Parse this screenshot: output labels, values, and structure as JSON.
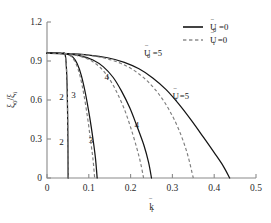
{
  "figure": {
    "background_color": "#ffffff",
    "solid_color": "#141414",
    "dashed_color": "#7d7d7d",
    "axis_color": "#8a8a8a"
  },
  "axes": {
    "x": {
      "label": "k̄",
      "label_sub": "r",
      "ticks": [
        "0",
        "0.1",
        "0.2",
        "0.3",
        "0.4",
        "0.5"
      ],
      "tick_values": [
        0,
        0.1,
        0.2,
        0.3,
        0.4,
        0.5
      ],
      "range": [
        0,
        0.5
      ]
    },
    "y": {
      "label_num": "ξ",
      "label_num_sub": "0",
      "label_den": "ξ",
      "label_den_sub": "i",
      "label": "ξ₀/ξᵢ",
      "ticks": [
        "0",
        "0.3",
        "0.6",
        "0.9",
        "1.2"
      ],
      "tick_values": [
        0,
        0.3,
        0.6,
        0.9,
        1.2
      ],
      "range": [
        0,
        1.2
      ]
    }
  },
  "legend": {
    "position": "top-right",
    "entries": [
      {
        "style": "solid",
        "symbol": "Ū",
        "sub": "0",
        "eq": "=0",
        "label": "Ū0 =0"
      },
      {
        "style": "dashed",
        "symbol": "Ū",
        "sub": "i",
        "eq": "=0",
        "label": "Ūi =0"
      }
    ]
  },
  "annotations": [
    {
      "name": "curve-label-2-upper",
      "text": "2",
      "x": 0.0345,
      "y": 0.6
    },
    {
      "name": "curve-label-2-lower",
      "text": "2",
      "x": 0.0345,
      "y": 0.255
    },
    {
      "name": "curve-label-3-upper",
      "text": "3",
      "x": 0.0635,
      "y": 0.615
    },
    {
      "name": "curve-label-3-lower",
      "text": "3",
      "x": 0.105,
      "y": 0.27
    },
    {
      "name": "curve-label-4-upper",
      "text": "4",
      "x": 0.143,
      "y": 0.755
    },
    {
      "name": "curve-label-4-lower",
      "text": "4",
      "x": 0.215,
      "y": 0.385
    },
    {
      "name": "curve-label-u0-5",
      "text": "Ū0 =5",
      "x": 0.232,
      "y": 0.935
    },
    {
      "name": "curve-label-ui-5",
      "text": "Ūi =5",
      "x": 0.3,
      "y": 0.605
    }
  ],
  "chart_data": {
    "type": "line",
    "title": "",
    "xlabel": "k̄r",
    "ylabel": "ξ0/ξi",
    "xlim": [
      0,
      0.5
    ],
    "ylim": [
      0,
      1.2
    ],
    "grid": false,
    "legend_position": "top-right",
    "plateau_value": 0.96,
    "series": [
      {
        "name": "Ū0 = 2",
        "style": "solid",
        "label": "2",
        "color": "#141414",
        "x": [
          0.0,
          0.02,
          0.035,
          0.044,
          0.048,
          0.05,
          0.0505
        ],
        "y": [
          0.96,
          0.96,
          0.958,
          0.94,
          0.72,
          0.3,
          0.0
        ]
      },
      {
        "name": "Ūi = 2",
        "style": "dashed",
        "label": "2",
        "color": "#7d7d7d",
        "x": [
          0.0,
          0.02,
          0.035,
          0.044,
          0.048,
          0.05,
          0.0505
        ],
        "y": [
          0.96,
          0.96,
          0.958,
          0.94,
          0.72,
          0.3,
          0.0
        ]
      },
      {
        "name": "Ū0 = 3",
        "style": "solid",
        "label": "3",
        "color": "#141414",
        "x": [
          0.0,
          0.03,
          0.05,
          0.062,
          0.072,
          0.082,
          0.092,
          0.102,
          0.11,
          0.116,
          0.12
        ],
        "y": [
          0.96,
          0.958,
          0.95,
          0.93,
          0.88,
          0.79,
          0.65,
          0.47,
          0.3,
          0.15,
          0.0
        ]
      },
      {
        "name": "Ūi = 3",
        "style": "dashed",
        "label": "3",
        "color": "#7d7d7d",
        "x": [
          0.0,
          0.03,
          0.05,
          0.06,
          0.07,
          0.079,
          0.088,
          0.097,
          0.104,
          0.11,
          0.114
        ],
        "y": [
          0.96,
          0.958,
          0.948,
          0.928,
          0.875,
          0.785,
          0.645,
          0.465,
          0.295,
          0.145,
          0.0
        ]
      },
      {
        "name": "Ū0 = 4",
        "style": "solid",
        "label": "4",
        "color": "#141414",
        "x": [
          0.0,
          0.04,
          0.08,
          0.11,
          0.135,
          0.158,
          0.178,
          0.198,
          0.215,
          0.232,
          0.243,
          0.25
        ],
        "y": [
          0.96,
          0.956,
          0.94,
          0.908,
          0.855,
          0.775,
          0.67,
          0.54,
          0.4,
          0.25,
          0.12,
          0.0
        ]
      },
      {
        "name": "Ūi = 4",
        "style": "dashed",
        "label": "4",
        "color": "#7d7d7d",
        "x": [
          0.0,
          0.04,
          0.078,
          0.105,
          0.128,
          0.148,
          0.167,
          0.185,
          0.2,
          0.214,
          0.224,
          0.231
        ],
        "y": [
          0.96,
          0.955,
          0.937,
          0.903,
          0.848,
          0.768,
          0.66,
          0.53,
          0.39,
          0.24,
          0.115,
          0.0
        ]
      },
      {
        "name": "Ū0 = 5",
        "style": "solid",
        "label": "Ū0 =5",
        "color": "#141414",
        "x": [
          0.0,
          0.05,
          0.1,
          0.145,
          0.185,
          0.22,
          0.253,
          0.285,
          0.315,
          0.345,
          0.375,
          0.4,
          0.422,
          0.437
        ],
        "y": [
          0.96,
          0.957,
          0.946,
          0.925,
          0.89,
          0.84,
          0.77,
          0.68,
          0.57,
          0.445,
          0.31,
          0.195,
          0.09,
          0.0
        ]
      },
      {
        "name": "Ūi = 5",
        "style": "dashed",
        "label": "Ūi =5",
        "color": "#7d7d7d",
        "x": [
          0.0,
          0.05,
          0.098,
          0.14,
          0.176,
          0.208,
          0.238,
          0.266,
          0.292,
          0.315,
          0.335,
          0.35
        ],
        "y": [
          0.96,
          0.956,
          0.944,
          0.92,
          0.882,
          0.828,
          0.752,
          0.652,
          0.525,
          0.375,
          0.195,
          0.0
        ]
      }
    ]
  }
}
